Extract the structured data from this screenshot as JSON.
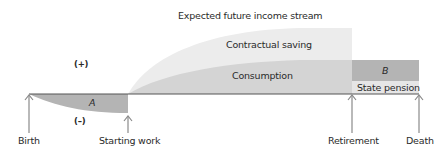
{
  "title": "Expected future income stream",
  "signs": {
    "positive": "(+)",
    "negative": "(–)"
  },
  "regions": {
    "contractual_saving": "Contractual saving",
    "consumption": "Consumption",
    "state_pension": "State pension",
    "area_a": "A",
    "area_b": "B"
  },
  "timeline": [
    {
      "label": "Birth"
    },
    {
      "label": "Starting work"
    },
    {
      "label": "Retirement"
    },
    {
      "label": "Death"
    }
  ],
  "colors": {
    "contractual_saving": "#ececec",
    "consumption": "#d4d4d4",
    "area_a": "#b4b4b4",
    "area_b": "#b4b4b4",
    "state_pension": "#e6e6e6",
    "axis": "#555555",
    "arrow": "#8a8a8a"
  }
}
